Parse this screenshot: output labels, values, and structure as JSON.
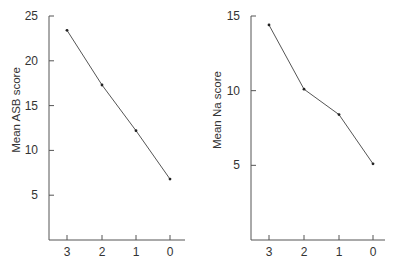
{
  "chart_data": [
    {
      "type": "line",
      "title": "",
      "xlabel": "",
      "ylabel": "Mean ASB score",
      "categories": [
        "3",
        "2",
        "1",
        "0"
      ],
      "values": [
        23.4,
        17.3,
        12.2,
        6.8
      ],
      "yticks": [
        5,
        10,
        15,
        20,
        25
      ],
      "ylim": [
        0,
        25
      ],
      "grid": false,
      "legend": null
    },
    {
      "type": "line",
      "title": "",
      "xlabel": "",
      "ylabel": "Mean Na score",
      "categories": [
        "3",
        "2",
        "1",
        "0"
      ],
      "values": [
        14.4,
        10.1,
        8.4,
        5.1
      ],
      "yticks": [
        5,
        10,
        15
      ],
      "ylim": [
        0,
        15
      ],
      "grid": false,
      "legend": null
    }
  ]
}
